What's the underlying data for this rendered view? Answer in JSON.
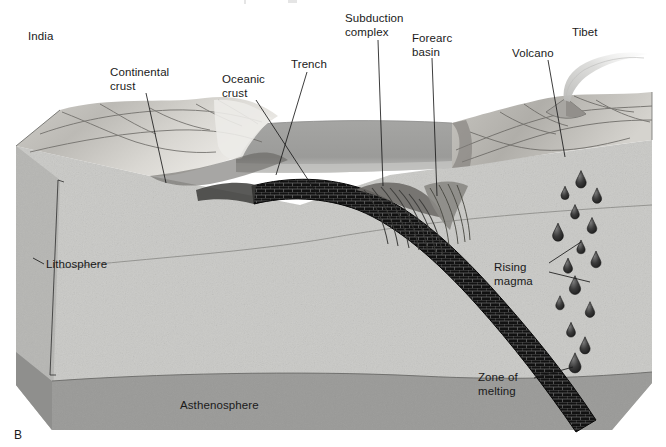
{
  "figure": {
    "letter": "B",
    "title_visible": false,
    "kind": "geologic block diagram — continental-arc subduction (India–Tibet collision zone)"
  },
  "palette": {
    "background": "#ffffff",
    "text": "#1a1a1a",
    "leader_line": "#1a1a1a",
    "lithosphere_fill": "#c9c9c6",
    "lithosphere_side_fill": "#bdbdba",
    "asthenosphere_fill": "#9a9a98",
    "asthenosphere_side_fill": "#8e8e8c",
    "ocean_fill": "#9d9d9b",
    "ocean_light_band": "#c4c4c2",
    "ocean_top_face": "#b5b5b3",
    "continent_top_light": "#d8d6d2",
    "continent_top_mid": "#bfbdb8",
    "continent_top_dark": "#8f8d89",
    "slab_fill": "#101010",
    "slab_hatch": "#6d6d6d",
    "magma_fill": "#2b2b2b",
    "magma_highlight": "#8a8a8a",
    "outline": "#3a3a3a",
    "plume_fill": "#d6d6d4"
  },
  "labels": [
    {
      "id": "india",
      "text": "India",
      "x": 28,
      "y": 30,
      "lines": [
        "India"
      ],
      "leader": false
    },
    {
      "id": "tibet",
      "text": "Tibet",
      "x": 572,
      "y": 26,
      "lines": [
        "Tibet"
      ],
      "leader": false
    },
    {
      "id": "continental-crust",
      "text": "Continental crust",
      "x": 110,
      "y": 66,
      "lines": [
        "Continental",
        "crust"
      ],
      "leader": true
    },
    {
      "id": "oceanic-crust",
      "text": "Oceanic crust",
      "x": 222,
      "y": 73,
      "lines": [
        "Oceanic",
        "crust"
      ],
      "leader": true
    },
    {
      "id": "trench",
      "text": "Trench",
      "x": 291,
      "y": 58,
      "lines": [
        "Trench"
      ],
      "leader": true
    },
    {
      "id": "subduction-complex",
      "text": "Subduction complex",
      "x": 345,
      "y": 12,
      "lines": [
        "Subduction",
        "complex"
      ],
      "leader": true
    },
    {
      "id": "forearc-basin",
      "text": "Forearc basin",
      "x": 412,
      "y": 32,
      "lines": [
        "Forearc",
        "basin"
      ],
      "leader": true
    },
    {
      "id": "volcano",
      "text": "Volcano",
      "x": 512,
      "y": 47,
      "lines": [
        "Volcano"
      ],
      "leader": true
    },
    {
      "id": "rising-magma",
      "text": "Rising magma",
      "x": 494,
      "y": 261,
      "lines": [
        "Rising",
        "magma"
      ],
      "leader": true
    },
    {
      "id": "zone-of-melting",
      "text": "Zone of melting",
      "x": 478,
      "y": 371,
      "lines": [
        "Zone of",
        "melting"
      ],
      "leader": true
    },
    {
      "id": "lithosphere",
      "text": "Lithosphere",
      "x": 46,
      "y": 258,
      "lines": [
        "Lithosphere"
      ],
      "leader": true
    },
    {
      "id": "asthenosphere",
      "text": "Asthenosphere",
      "x": 180,
      "y": 399,
      "lines": [
        "Asthenosphere"
      ],
      "leader": false
    }
  ],
  "leader_lines": [
    {
      "id": "leader-continental-crust",
      "from": [
        146,
        93
      ],
      "to": [
        166,
        183
      ]
    },
    {
      "id": "leader-oceanic-crust",
      "from": [
        256,
        100
      ],
      "to": [
        318,
        195
      ]
    },
    {
      "id": "leader-trench",
      "from": [
        307,
        72
      ],
      "to": [
        276,
        175
      ]
    },
    {
      "id": "leader-subduction-complex",
      "from": [
        378,
        40
      ],
      "to": [
        383,
        186
      ]
    },
    {
      "id": "leader-forearc-basin",
      "from": [
        432,
        58
      ],
      "to": [
        437,
        196
      ]
    },
    {
      "id": "leader-volcano",
      "from": [
        548,
        60
      ],
      "to": [
        565,
        157
      ]
    },
    {
      "id": "leader-rising-magma-a",
      "from": [
        549,
        263
      ],
      "to": [
        581,
        242
      ]
    },
    {
      "id": "leader-rising-magma-b",
      "from": [
        549,
        272
      ],
      "to": [
        590,
        282
      ]
    },
    {
      "id": "leader-zone-of-melting",
      "from": [
        534,
        378
      ],
      "to": [
        573,
        367
      ]
    },
    {
      "id": "leader-lithosphere",
      "from": [
        44,
        264
      ],
      "to": [
        33,
        258
      ]
    }
  ],
  "regions": [
    {
      "id": "lithosphere-block",
      "name": "lithosphere",
      "label": "Lithosphere"
    },
    {
      "id": "asthenosphere-band",
      "name": "asthenosphere",
      "label": "Asthenosphere"
    },
    {
      "id": "ocean-water",
      "name": "ocean-water",
      "label": ""
    },
    {
      "id": "subducting-slab",
      "name": "subducting-slab",
      "label": ""
    },
    {
      "id": "accretionary-wedge",
      "name": "subduction-complex",
      "label": ""
    },
    {
      "id": "forearc-basin-body",
      "name": "forearc-basin",
      "label": ""
    },
    {
      "id": "volcano-cone",
      "name": "volcano",
      "label": ""
    },
    {
      "id": "magma-field",
      "name": "rising-magma",
      "label": ""
    }
  ],
  "magma_blobs": [
    {
      "cx": 581,
      "cy": 182,
      "r": 5.2
    },
    {
      "cx": 565,
      "cy": 195,
      "r": 4.0
    },
    {
      "cx": 597,
      "cy": 198,
      "r": 4.6
    },
    {
      "cx": 575,
      "cy": 214,
      "r": 4.3
    },
    {
      "cx": 592,
      "cy": 228,
      "r": 4.8
    },
    {
      "cx": 558,
      "cy": 235,
      "r": 5.4
    },
    {
      "cx": 581,
      "cy": 249,
      "r": 4.1
    },
    {
      "cx": 568,
      "cy": 268,
      "r": 4.5
    },
    {
      "cx": 596,
      "cy": 262,
      "r": 5.0
    },
    {
      "cx": 575,
      "cy": 288,
      "r": 5.6
    },
    {
      "cx": 560,
      "cy": 305,
      "r": 4.2
    },
    {
      "cx": 590,
      "cy": 312,
      "r": 4.7
    },
    {
      "cx": 571,
      "cy": 332,
      "r": 4.4
    },
    {
      "cx": 585,
      "cy": 348,
      "r": 5.1
    },
    {
      "cx": 575,
      "cy": 366,
      "r": 6.0
    }
  ]
}
